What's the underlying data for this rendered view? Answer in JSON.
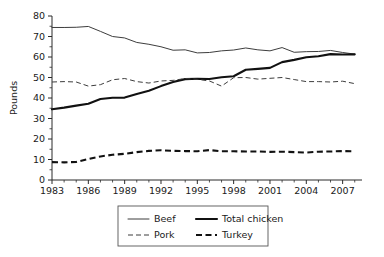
{
  "chart_data": {
    "type": "line",
    "title": "",
    "xlabel": "",
    "ylabel": "Pounds",
    "xlim": [
      1983,
      2008.6
    ],
    "ylim": [
      0,
      80
    ],
    "ytick_step": 10,
    "yticks": [
      0,
      10,
      20,
      30,
      40,
      50,
      60,
      70,
      80
    ],
    "ytick_labels": [
      "0",
      "10",
      "20",
      "30",
      "40",
      "50",
      "60",
      "70",
      "80"
    ],
    "xticks": [
      1983,
      1986,
      1989,
      1992,
      1995,
      1998,
      2001,
      2004,
      2007
    ],
    "xtick_labels": [
      "1983",
      "1986",
      "1989",
      "1992",
      "1995",
      "1998",
      "2001",
      "2004",
      "2007"
    ],
    "x": [
      1983,
      1984,
      1985,
      1986,
      1987,
      1988,
      1989,
      1990,
      1991,
      1992,
      1993,
      1994,
      1995,
      1996,
      1997,
      1998,
      1999,
      2000,
      2001,
      2002,
      2003,
      2004,
      2005,
      2006,
      2007,
      2008
    ],
    "grid": false,
    "legend_position": "below-center",
    "series": [
      {
        "name": "Beef",
        "style": "thin-solid",
        "color": "#3d3d3d",
        "values": [
          74.4,
          74.4,
          74.5,
          74.9,
          72.5,
          70.0,
          69.3,
          67.1,
          66.2,
          65.0,
          63.3,
          63.5,
          62.0,
          62.2,
          63.0,
          63.4,
          64.4,
          63.5,
          63.0,
          64.6,
          62.3,
          62.6,
          62.7,
          63.2,
          62.2,
          61.4
        ]
      },
      {
        "name": "Total chicken",
        "style": "thick-solid",
        "color": "#111111",
        "values": [
          34.5,
          35.3,
          36.3,
          37.2,
          39.5,
          40.1,
          40.2,
          42.0,
          43.5,
          45.8,
          47.8,
          49.2,
          49.4,
          49.3,
          50.1,
          50.6,
          53.8,
          54.2,
          54.7,
          57.5,
          58.6,
          59.9,
          60.4,
          61.4,
          61.2,
          61.3
        ]
      },
      {
        "name": "Pork",
        "style": "thin-dash",
        "color": "#3d3d3d",
        "values": [
          47.8,
          48.0,
          47.8,
          45.8,
          46.5,
          48.9,
          49.5,
          48.0,
          47.3,
          48.3,
          48.6,
          49.5,
          49.1,
          48.3,
          45.8,
          49.9,
          50.0,
          49.2,
          49.6,
          50.0,
          49.0,
          48.0,
          48.0,
          47.8,
          48.2,
          47.0
        ]
      },
      {
        "name": "Turkey",
        "style": "thick-dash",
        "color": "#111111",
        "values": [
          8.7,
          8.6,
          8.8,
          10.2,
          11.5,
          12.3,
          12.8,
          13.6,
          14.2,
          14.5,
          14.2,
          14.1,
          14.0,
          14.6,
          14.0,
          14.0,
          13.9,
          13.9,
          13.7,
          13.8,
          13.6,
          13.4,
          13.8,
          13.9,
          14.1,
          14.0
        ]
      }
    ],
    "legend_entries": [
      {
        "label": "Beef",
        "style": "thin-solid"
      },
      {
        "label": "Total chicken",
        "style": "thick-solid"
      },
      {
        "label": "Pork",
        "style": "thin-dash"
      },
      {
        "label": "Turkey",
        "style": "thick-dash"
      }
    ]
  }
}
